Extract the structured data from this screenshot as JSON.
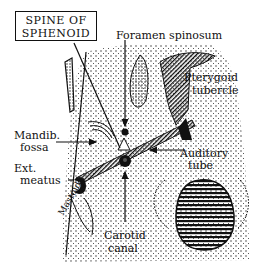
{
  "figure": {
    "labels": {
      "spine_of_sphenoid_line1": "SPINE OF",
      "spine_of_sphenoid_line2": "SPHENOID",
      "foramen_spinosum": "Foramen spinosum",
      "pterygoid_tubercle_line1": "Pterygoid",
      "pterygoid_tubercle_line2": "tubercle",
      "mandib_fossa_line1": "Mandib.",
      "mandib_fossa_line2": "fossa",
      "ext_meatus_line1": "Ext.",
      "ext_meatus_line2": "meatus",
      "mastoid": "Mastoid",
      "auditory_tube_line1": "Auditory",
      "auditory_tube_line2": "tube",
      "carotid_canal_line1": "Carotid",
      "carotid_canal_line2": "canal"
    },
    "colors": {
      "ink": "#111111",
      "background": "#ffffff"
    }
  }
}
